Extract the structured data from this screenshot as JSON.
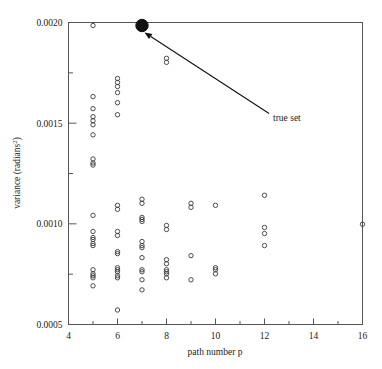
{
  "chart_data": {
    "type": "scatter",
    "title": "",
    "xlabel": "path number p",
    "ylabel": "variance (radians²)",
    "ylabel_base": "variance (radians",
    "ylabel_sup": "2",
    "ylabel_tail": ")",
    "xlim": [
      4,
      16
    ],
    "ylim": [
      0.0005,
      0.002
    ],
    "grid": false,
    "legend_position": "none",
    "xticks": [
      4,
      6,
      8,
      10,
      12,
      14,
      16
    ],
    "xtick_labels": [
      "4",
      "6",
      "8",
      "10",
      "12",
      "14",
      "16"
    ],
    "xminorticks": [
      5,
      7,
      9,
      11,
      13,
      15
    ],
    "yticks": [
      0.0005,
      0.001,
      0.0015,
      0.002
    ],
    "ytick_labels": [
      "0.0005",
      "0.0010",
      "0.0015",
      "0.0020"
    ],
    "yminorticks": [
      0.00075,
      0.00125,
      0.00175
    ],
    "series": [
      {
        "name": "estimated sets",
        "marker": "open-circle",
        "color": "#3a3a3a",
        "points": [
          [
            5,
            0.001985
          ],
          [
            5,
            0.001632
          ],
          [
            5,
            0.001572
          ],
          [
            5,
            0.001532
          ],
          [
            5,
            0.001512
          ],
          [
            5,
            0.001492
          ],
          [
            5,
            0.001442
          ],
          [
            5,
            0.001322
          ],
          [
            5,
            0.001302
          ],
          [
            5,
            0.001292
          ],
          [
            5,
            0.001042
          ],
          [
            5,
            0.000962
          ],
          [
            5,
            0.000932
          ],
          [
            5,
            0.000922
          ],
          [
            5,
            0.000902
          ],
          [
            5,
            0.000892
          ],
          [
            5,
            0.000772
          ],
          [
            5,
            0.000752
          ],
          [
            5,
            0.000742
          ],
          [
            5,
            0.000732
          ],
          [
            5,
            0.000692
          ],
          [
            6,
            0.001722
          ],
          [
            6,
            0.001702
          ],
          [
            6,
            0.001682
          ],
          [
            6,
            0.001652
          ],
          [
            6,
            0.001602
          ],
          [
            6,
            0.001542
          ],
          [
            6,
            0.001092
          ],
          [
            6,
            0.001072
          ],
          [
            6,
            0.000962
          ],
          [
            6,
            0.000942
          ],
          [
            6,
            0.000862
          ],
          [
            6,
            0.000852
          ],
          [
            6,
            0.000782
          ],
          [
            6,
            0.000772
          ],
          [
            6,
            0.000762
          ],
          [
            6,
            0.000742
          ],
          [
            6,
            0.000732
          ],
          [
            6,
            0.000572
          ],
          [
            7,
            0.001122
          ],
          [
            7,
            0.001102
          ],
          [
            7,
            0.001032
          ],
          [
            7,
            0.001022
          ],
          [
            7,
            0.001012
          ],
          [
            7,
            0.000912
          ],
          [
            7,
            0.000892
          ],
          [
            7,
            0.000882
          ],
          [
            7,
            0.000832
          ],
          [
            7,
            0.000772
          ],
          [
            7,
            0.000762
          ],
          [
            7,
            0.000722
          ],
          [
            7,
            0.000672
          ],
          [
            8,
            0.001822
          ],
          [
            8,
            0.001802
          ],
          [
            8,
            0.000992
          ],
          [
            8,
            0.000972
          ],
          [
            8,
            0.000822
          ],
          [
            8,
            0.000802
          ],
          [
            8,
            0.000772
          ],
          [
            8,
            0.000762
          ],
          [
            8,
            0.000752
          ],
          [
            8,
            0.000732
          ],
          [
            9,
            0.001102
          ],
          [
            9,
            0.001082
          ],
          [
            9,
            0.000842
          ],
          [
            9,
            0.000722
          ],
          [
            10,
            0.001092
          ],
          [
            10,
            0.000782
          ],
          [
            10,
            0.000772
          ],
          [
            10,
            0.000752
          ],
          [
            12,
            0.001142
          ],
          [
            12,
            0.000982
          ],
          [
            12,
            0.000952
          ],
          [
            12,
            0.000892
          ],
          [
            16,
            0.000998
          ]
        ]
      },
      {
        "name": "true set",
        "marker": "filled-circle",
        "color": "#111111",
        "points": [
          [
            7,
            0.001985
          ]
        ]
      }
    ],
    "annotations": [
      {
        "text": "true set",
        "target_x": 7.05,
        "target_y": 0.001955,
        "text_x": 12.35,
        "text_y": 0.001528
      }
    ]
  }
}
